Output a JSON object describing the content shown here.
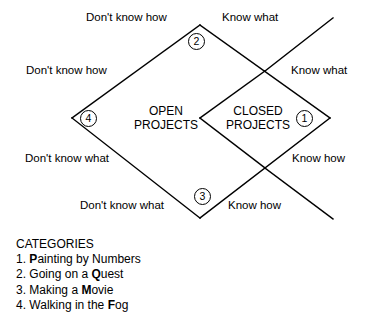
{
  "diagram": {
    "type": "knowledge-matrix-diamond",
    "regions": [
      {
        "id": "open-projects",
        "line1": "OPEN",
        "line2": "PROJECTS"
      },
      {
        "id": "closed-projects",
        "line1": "CLOSED",
        "line2": "PROJECTS"
      }
    ],
    "axis_labels": [
      {
        "id": "dont-know-how-top",
        "text": "Don't know how"
      },
      {
        "id": "know-what-top",
        "text": "Know what"
      },
      {
        "id": "dont-know-how-upper-left",
        "text": "Don't know how"
      },
      {
        "id": "know-what-upper-right",
        "text": "Know what"
      },
      {
        "id": "dont-know-what-lower-left",
        "text": "Don't know what"
      },
      {
        "id": "know-how-lower-right",
        "text": "Know how"
      },
      {
        "id": "dont-know-what-bottom",
        "text": "Don't know what"
      },
      {
        "id": "know-how-bottom",
        "text": "Know how"
      }
    ],
    "badges": [
      {
        "id": "badge-1",
        "label": "1"
      },
      {
        "id": "badge-2",
        "label": "2"
      },
      {
        "id": "badge-3",
        "label": "3"
      },
      {
        "id": "badge-4",
        "label": "4"
      }
    ]
  },
  "categories": {
    "heading": "CATEGORIES",
    "items": [
      {
        "number": "1.",
        "prefix": "",
        "bold": "P",
        "suffix": "ainting by Numbers"
      },
      {
        "number": "2.",
        "prefix": "Going on a ",
        "bold": "Q",
        "suffix": "uest"
      },
      {
        "number": "3.",
        "prefix": "Making a ",
        "bold": "M",
        "suffix": "ovie"
      },
      {
        "number": "4.",
        "prefix": "Walking in the ",
        "bold": "F",
        "suffix": "og"
      }
    ]
  },
  "colors": {
    "stroke": "#000000",
    "background": "#ffffff",
    "text": "#000000"
  }
}
